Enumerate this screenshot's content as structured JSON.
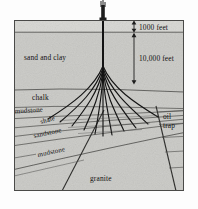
{
  "figure": {
    "type": "geological-cross-section",
    "title_visible": false,
    "frame": {
      "x": 14,
      "y": 20,
      "width": 170,
      "height": 171
    },
    "colors": {
      "rock_fill": "#c9c9c5",
      "surface_band_fill": "#d6d6d2",
      "stratum_line": "#3a3a38",
      "frame_border": "#4a4a48",
      "wellbore": "#1a1a1a",
      "text": "#111111",
      "page_background": "#fdfdfd"
    }
  },
  "depth_scale": {
    "ruler_x": 134,
    "marks": [
      {
        "label": "1000 feet",
        "from_y": 21,
        "to_y": 32,
        "text_x": 139,
        "text_y": 29
      },
      {
        "label": "10,000 feet",
        "from_y": 32,
        "to_y": 84,
        "text_x": 139,
        "text_y": 61
      }
    ]
  },
  "strata": [
    {
      "name": "surface-band",
      "label": "",
      "label_x": 0,
      "label_y": 0,
      "rotate": 0
    },
    {
      "name": "sand-and-clay",
      "label": "sand and clay",
      "label_x": 24,
      "label_y": 60,
      "rotate": 0
    },
    {
      "name": "chalk",
      "label": "chalk",
      "label_x": 32,
      "label_y": 99,
      "rotate": 0
    },
    {
      "name": "mudstone-upper",
      "label": "mudstone",
      "label_x": 15,
      "label_y": 113,
      "rotate": -4
    },
    {
      "name": "shale",
      "label": "shale",
      "label_x": 40,
      "label_y": 123,
      "rotate": -16
    },
    {
      "name": "sandstone",
      "label": "sandstone",
      "label_x": 34,
      "label_y": 137,
      "rotate": -11
    },
    {
      "name": "mudstone-lower",
      "label": "mudstone",
      "label_x": 38,
      "label_y": 156,
      "rotate": -11
    },
    {
      "name": "granite",
      "label": "granite",
      "label_x": 90,
      "label_y": 180,
      "rotate": 0
    }
  ],
  "annotations": [
    {
      "name": "oil-trap",
      "lines": [
        "oil",
        "trap"
      ],
      "x": 164,
      "y": 120
    }
  ],
  "rig": {
    "name": "drilling-derrick",
    "x": 103,
    "base_y": 21,
    "height": 20
  },
  "wellbores": {
    "count": 11,
    "origin_x": 103,
    "origin_y": 21,
    "description": "fan of directional boreholes spreading from a single vertical stem toward the oil trap"
  }
}
